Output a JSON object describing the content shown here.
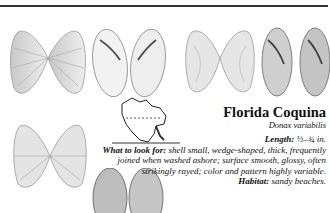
{
  "page": {
    "species": {
      "common_name": "Florida Coquina",
      "scientific_name": "Donax variabilis"
    },
    "details": [
      {
        "label": "Length:",
        "text": " ½–¾ in."
      },
      {
        "label": "What to look for:",
        "text": " shell small, wedge-shaped, thick, frequently joined when washed ashore; surface smooth, glossy, often strikingly rayed; color and pattern highly variable."
      },
      {
        "label": "Habitat:",
        "text": " sandy beaches."
      }
    ],
    "illustrations": [
      "shell-pair-rayed-top-left",
      "shell-pair-interior-top-center",
      "shell-pair-rayed-top-right",
      "shell-pair-interior-top-far-right",
      "shell-pair-rayed-bottom-left",
      "shell-pair-interior-bottom-center",
      "range-map-north-america"
    ]
  }
}
